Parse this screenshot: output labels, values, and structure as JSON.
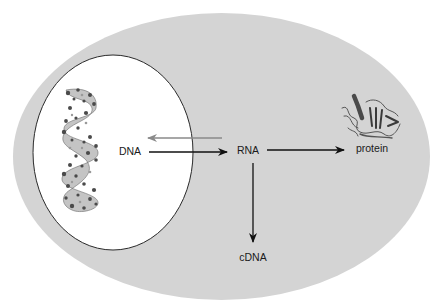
{
  "diagram": {
    "type": "flow",
    "colors": {
      "background": "#ffffff",
      "cell": "#d4d4d4",
      "nucleus_fill": "#ffffff",
      "nucleus_stroke": "#2a2a2a",
      "arrow": "#111111",
      "reverse_arrow": "#8a8a8a",
      "molecule": "#555555"
    },
    "regions": {
      "cell": {
        "name": "cell"
      },
      "nucleus": {
        "name": "nucleus"
      }
    },
    "nodes": [
      {
        "id": "dna",
        "label": "DNA",
        "x": 130,
        "y": 151
      },
      {
        "id": "rna",
        "label": "RNA",
        "x": 248,
        "y": 150
      },
      {
        "id": "protein",
        "label": "protein",
        "x": 372,
        "y": 148
      },
      {
        "id": "cdna",
        "label": "cDNA",
        "x": 253,
        "y": 257
      }
    ],
    "edges": [
      {
        "from": "dna",
        "to": "rna",
        "style": "black"
      },
      {
        "from": "rna",
        "to": "dna",
        "style": "gray"
      },
      {
        "from": "rna",
        "to": "protein",
        "style": "black"
      },
      {
        "from": "rna",
        "to": "cdna",
        "style": "black"
      }
    ],
    "icons": {
      "dna_structure": "dna-double-helix-icon",
      "protein_structure": "protein-ribbon-icon"
    }
  }
}
